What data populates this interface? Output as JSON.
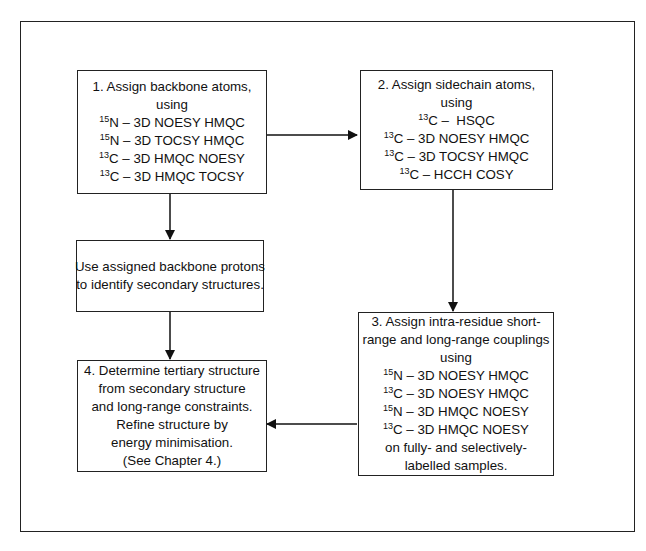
{
  "diagram": {
    "type": "flowchart",
    "boxes": {
      "step1": {
        "title": "1. Assign backbone atoms,",
        "subtitle": "using",
        "experiments": [
          {
            "isotope": "15",
            "element": "N",
            "method": " – 3D NOESY HMQC"
          },
          {
            "isotope": "15",
            "element": "N",
            "method": " – 3D TOCSY HMQC"
          },
          {
            "isotope": "13",
            "element": "C",
            "method": " – 3D HMQC NOESY"
          },
          {
            "isotope": "13",
            "element": "C",
            "method": " – 3D HMQC TOCSY"
          }
        ]
      },
      "step2": {
        "title": "2. Assign sidechain atoms,",
        "subtitle": "using",
        "experiments": [
          {
            "isotope": "13",
            "element": "C",
            "method": " –  HSQC"
          },
          {
            "isotope": "13",
            "element": "C",
            "method": " – 3D NOESY HMQC"
          },
          {
            "isotope": "13",
            "element": "C",
            "method": " – 3D TOCSY HMQC"
          },
          {
            "isotope": "13",
            "element": "C",
            "method": " – HCCH COSY"
          }
        ]
      },
      "secondary": {
        "lines": [
          "Use assigned backbone protons",
          "to identify secondary structures."
        ]
      },
      "step3": {
        "lines_top": [
          "3. Assign intra-residue short-",
          "range and long-range couplings",
          "using"
        ],
        "experiments": [
          {
            "isotope": "15",
            "element": "N",
            "method": " – 3D NOESY HMQC"
          },
          {
            "isotope": "13",
            "element": "C",
            "method": " – 3D NOESY HMQC"
          },
          {
            "isotope": "15",
            "element": "N",
            "method": " – 3D HMQC NOESY"
          },
          {
            "isotope": "13",
            "element": "C",
            "method": " – 3D HMQC NOESY"
          }
        ],
        "lines_bottom": [
          "on fully- and selectively-",
          "labelled samples."
        ]
      },
      "step4": {
        "lines": [
          "4. Determine tertiary structure",
          "from secondary structure",
          "and long-range constraints.",
          "Refine structure by",
          "energy minimisation.",
          "(See Chapter 4.)"
        ]
      }
    },
    "edges": [
      {
        "from": "step1",
        "to": "step2"
      },
      {
        "from": "step1",
        "to": "secondary"
      },
      {
        "from": "secondary",
        "to": "step4"
      },
      {
        "from": "step2",
        "to": "step3"
      },
      {
        "from": "step3",
        "to": "step4"
      }
    ]
  }
}
